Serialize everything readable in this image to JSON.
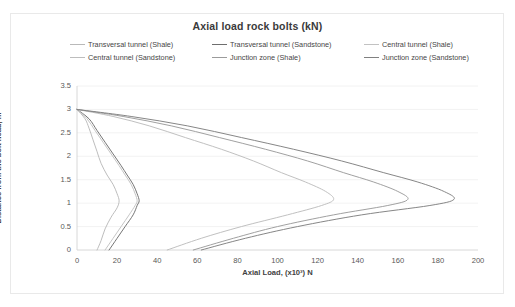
{
  "chart_data": {
    "type": "line",
    "title": "Axial load rock bolts (kN)",
    "xlabel": "Axial Load, (x10³) N",
    "ylabel": "Distance from the bolt head, m",
    "xlim": [
      0,
      200
    ],
    "ylim": [
      0,
      3.5
    ],
    "xticks": [
      0,
      20,
      40,
      60,
      80,
      100,
      120,
      140,
      160,
      180,
      200
    ],
    "yticks": [
      0,
      0.5,
      1,
      1.5,
      2,
      2.5,
      3,
      3.5
    ],
    "grid": "horizontal",
    "legend_position": "top",
    "series": [
      {
        "name": "Transversal tunnel (Shale)",
        "color": "#b9b9b9",
        "points": [
          [
            10,
            0
          ],
          [
            12,
            0.2
          ],
          [
            14,
            0.45
          ],
          [
            17,
            0.7
          ],
          [
            20,
            0.9
          ],
          [
            21,
            1.05
          ],
          [
            20,
            1.2
          ],
          [
            18,
            1.4
          ],
          [
            15,
            1.6
          ],
          [
            12,
            1.85
          ],
          [
            10,
            2.1
          ],
          [
            8,
            2.35
          ],
          [
            6,
            2.6
          ],
          [
            4,
            2.8
          ],
          [
            0,
            3
          ]
        ]
      },
      {
        "name": "Transversal tunnel (Sandstone)",
        "color": "#6e6e6e",
        "points": [
          [
            16,
            0
          ],
          [
            20,
            0.25
          ],
          [
            24,
            0.5
          ],
          [
            28,
            0.75
          ],
          [
            30,
            0.95
          ],
          [
            31,
            1.05
          ],
          [
            30,
            1.2
          ],
          [
            28,
            1.4
          ],
          [
            25,
            1.6
          ],
          [
            22,
            1.8
          ],
          [
            18,
            2.05
          ],
          [
            14,
            2.3
          ],
          [
            10,
            2.55
          ],
          [
            6,
            2.8
          ],
          [
            0,
            3
          ]
        ]
      },
      {
        "name": "Central tunnel (Shale)",
        "color": "#c2c2c2",
        "points": [
          [
            14,
            0
          ],
          [
            18,
            0.25
          ],
          [
            22,
            0.5
          ],
          [
            26,
            0.75
          ],
          [
            29,
            0.95
          ],
          [
            30,
            1.05
          ],
          [
            29,
            1.2
          ],
          [
            27,
            1.4
          ],
          [
            24,
            1.6
          ],
          [
            21,
            1.8
          ],
          [
            17,
            2.05
          ],
          [
            13,
            2.3
          ],
          [
            9,
            2.55
          ],
          [
            5,
            2.8
          ],
          [
            0,
            3
          ]
        ]
      },
      {
        "name": "Central tunnel (Sandstone)",
        "color": "#bdbdbd",
        "points": [
          [
            45,
            0
          ],
          [
            62,
            0.25
          ],
          [
            82,
            0.5
          ],
          [
            105,
            0.75
          ],
          [
            122,
            0.95
          ],
          [
            128,
            1.08
          ],
          [
            124,
            1.25
          ],
          [
            114,
            1.45
          ],
          [
            102,
            1.65
          ],
          [
            88,
            1.9
          ],
          [
            72,
            2.15
          ],
          [
            54,
            2.4
          ],
          [
            36,
            2.65
          ],
          [
            18,
            2.85
          ],
          [
            0,
            3
          ]
        ]
      },
      {
        "name": "Junction zone (Shale)",
        "color": "#9b9b9b",
        "points": [
          [
            58,
            0
          ],
          [
            78,
            0.25
          ],
          [
            100,
            0.5
          ],
          [
            128,
            0.75
          ],
          [
            155,
            0.95
          ],
          [
            165,
            1.08
          ],
          [
            160,
            1.25
          ],
          [
            148,
            1.45
          ],
          [
            133,
            1.65
          ],
          [
            115,
            1.9
          ],
          [
            94,
            2.15
          ],
          [
            71,
            2.4
          ],
          [
            47,
            2.65
          ],
          [
            23,
            2.85
          ],
          [
            0,
            3
          ]
        ]
      },
      {
        "name": "Junction zone (Sandstone)",
        "color": "#808080",
        "points": [
          [
            62,
            0
          ],
          [
            84,
            0.25
          ],
          [
            110,
            0.5
          ],
          [
            142,
            0.75
          ],
          [
            176,
            0.95
          ],
          [
            188,
            1.08
          ],
          [
            183,
            1.25
          ],
          [
            170,
            1.45
          ],
          [
            153,
            1.65
          ],
          [
            132,
            1.9
          ],
          [
            108,
            2.15
          ],
          [
            82,
            2.4
          ],
          [
            55,
            2.65
          ],
          [
            27,
            2.85
          ],
          [
            0,
            3
          ]
        ]
      }
    ]
  },
  "legend": {
    "rows": [
      [
        {
          "label": "Transversal tunnel (Shale)",
          "color": "#b9b9b9"
        },
        {
          "label": "Transversal tunnel (Sandstone)",
          "color": "#6e6e6e"
        },
        {
          "label": "Central tunnel (Shale)",
          "color": "#c2c2c2"
        }
      ],
      [
        {
          "label": "Central tunnel (Sandstone)",
          "color": "#bdbdbd"
        },
        {
          "label": "Junction zone (Shale)",
          "color": "#9b9b9b"
        },
        {
          "label": "Junction zone (Sandstone)",
          "color": "#808080"
        }
      ]
    ]
  }
}
